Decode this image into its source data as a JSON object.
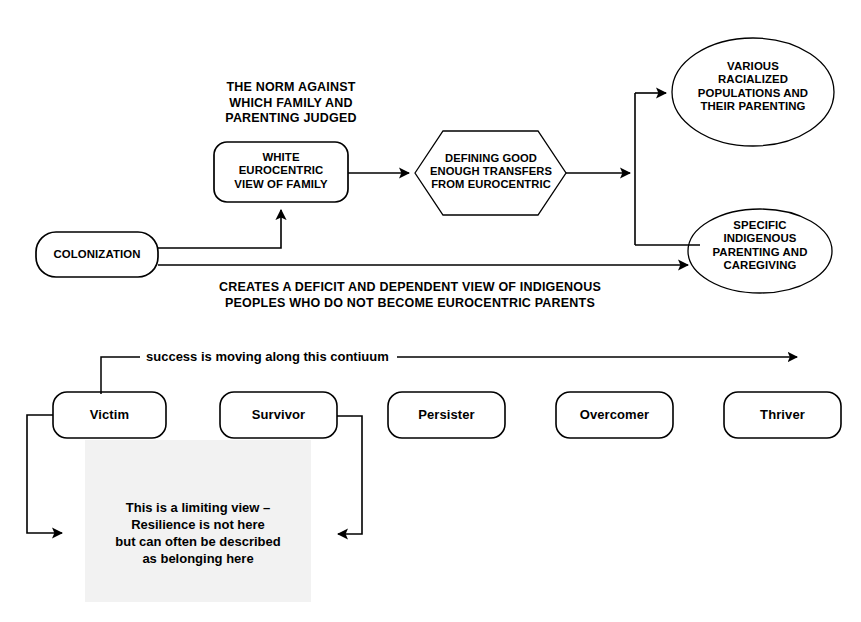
{
  "diagram": {
    "title_visible": false,
    "background": "#ffffff",
    "stroke": "#000000",
    "shade_color": "#f2f2f2",
    "top_section": {
      "nodes": [
        {
          "id": "colonization",
          "shape": "rounded-rect",
          "text": "COLONIZATION"
        },
        {
          "id": "white-eurocentric-view",
          "shape": "rounded-rect",
          "text": "WHITE\nEUROCENTRIC\nVIEW OF FAMILY"
        },
        {
          "id": "defining-good-enough",
          "shape": "hexagon",
          "text": "DEFINING GOOD\nENOUGH TRANSFERS\nFROM EUROCENTRIC"
        },
        {
          "id": "racialized-populations",
          "shape": "ellipse",
          "text": "VARIOUS\nRACIALIZED\nPOPULATIONS AND\nTHEIR PARENTING"
        },
        {
          "id": "indigenous-parenting",
          "shape": "ellipse",
          "text": "SPECIFIC\nINDIGENOUS\nPARENTING AND\nCAREGIVING"
        }
      ],
      "annotations": [
        {
          "id": "norm-note",
          "text": "THE NORM AGAINST\nWHICH FAMILY AND\nPARENTING JUDGED"
        },
        {
          "id": "deficit-note",
          "text": "CREATES A DEFICIT AND DEPENDENT VIEW OF INDIGENOUS\nPEOPLES WHO DO NOT BECOME EUROCENTRIC PARENTS"
        }
      ]
    },
    "continuum_section": {
      "caption": "success is moving along this contiuum",
      "stages": [
        {
          "id": "victim",
          "label": "Victim"
        },
        {
          "id": "survivor",
          "label": "Survivor"
        },
        {
          "id": "persister",
          "label": "Persister"
        },
        {
          "id": "overcomer",
          "label": "Overcomer"
        },
        {
          "id": "thriver",
          "label": "Thriver"
        }
      ],
      "shaded_note": "This is a limiting view –\nResilience is not here\nbut can often be described\nas belonging here"
    }
  }
}
